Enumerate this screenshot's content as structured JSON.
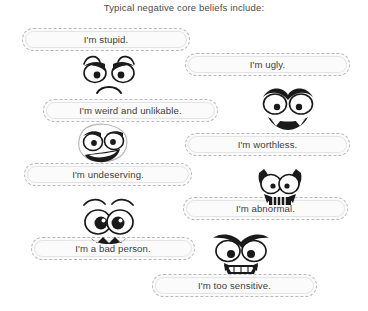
{
  "page": {
    "title": "Typical negative core beliefs include:",
    "background_color": "#ffffff",
    "text_color": "#3d3d3d",
    "bubble_fill": "#fbfbfb",
    "bubble_border": "#b9b9b9",
    "ink_color": "#1a1a1a"
  },
  "bubbles": [
    {
      "id": "stupid",
      "text": "I'm stupid.",
      "x": 22,
      "y": 28,
      "w": 168,
      "h": 23
    },
    {
      "id": "ugly",
      "text": "I'm ugly.",
      "x": 185,
      "y": 53,
      "w": 165,
      "h": 23
    },
    {
      "id": "weird",
      "text": "I'm weird and unlikable.",
      "x": 43,
      "y": 99,
      "w": 175,
      "h": 23
    },
    {
      "id": "worthless",
      "text": "I'm worthless.",
      "x": 185,
      "y": 133,
      "w": 165,
      "h": 23
    },
    {
      "id": "undeserving",
      "text": "I'm undeserving.",
      "x": 24,
      "y": 163,
      "w": 168,
      "h": 23
    },
    {
      "id": "abnormal",
      "text": "I'm abnormal.",
      "x": 183,
      "y": 197,
      "w": 165,
      "h": 23
    },
    {
      "id": "bad-person",
      "text": "I'm a bad person.",
      "x": 31,
      "y": 237,
      "w": 164,
      "h": 23
    },
    {
      "id": "too-sensitive",
      "text": "I'm too sensitive.",
      "x": 152,
      "y": 274,
      "w": 165,
      "h": 23
    }
  ],
  "faces": [
    {
      "id": "angry-frown",
      "label": "angry frowning face",
      "x": 78,
      "y": 52,
      "w": 62,
      "h": 47
    },
    {
      "id": "angry-wide-eyes",
      "label": "angry wide eyed face",
      "x": 258,
      "y": 86,
      "w": 60,
      "h": 44
    },
    {
      "id": "smirking",
      "label": "smirking sly face",
      "x": 72,
      "y": 122,
      "w": 62,
      "h": 47
    },
    {
      "id": "horned-grin",
      "label": "horned grinning face",
      "x": 250,
      "y": 161,
      "w": 60,
      "h": 47
    },
    {
      "id": "worried-big-eyes",
      "label": "worried big eyed face",
      "x": 74,
      "y": 196,
      "w": 68,
      "h": 50
    },
    {
      "id": "angry-gritted",
      "label": "angry gritted teeth face",
      "x": 210,
      "y": 231,
      "w": 62,
      "h": 47
    }
  ]
}
